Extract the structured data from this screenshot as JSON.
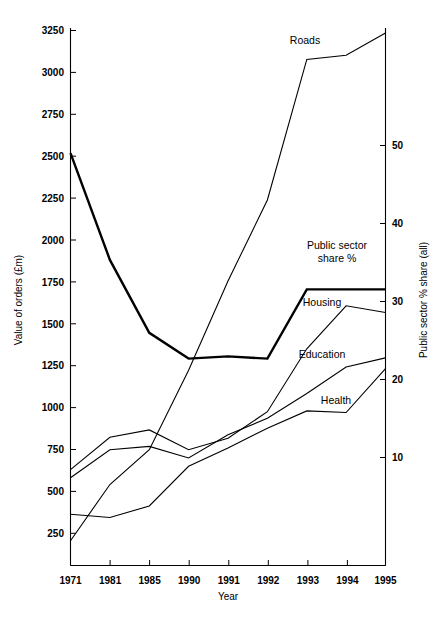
{
  "chart_data": {
    "type": "line",
    "title": "",
    "xlabel": "Year",
    "ylabel": "Value of orders (£m)",
    "y2label": "Public sector % share (all)",
    "categories": [
      "1971",
      "1981",
      "1985",
      "1990",
      "1991",
      "1992",
      "1993",
      "1994",
      "1995"
    ],
    "ylim": [
      0,
      3250
    ],
    "yticks": [
      250,
      500,
      750,
      1000,
      1250,
      1500,
      1750,
      2000,
      2250,
      2500,
      2750,
      3000,
      3250
    ],
    "y2lim": [
      0,
      73
    ],
    "y2ticks": [
      10,
      20,
      30,
      40,
      50
    ],
    "grid": false,
    "legend": "inline-labels",
    "series": [
      {
        "name": "Roads",
        "axis": "left",
        "label": "Roads",
        "values": [
          150,
          490,
          700,
          1180,
          1720,
          2210,
          3060,
          3085,
          3220
        ]
      },
      {
        "name": "Public sector share %",
        "axis": "right",
        "label": "Public sector share %",
        "emphasis": "thick",
        "values": [
          56.0,
          41.5,
          31.6,
          28.1,
          28.4,
          28.1,
          37.5,
          37.5,
          37.5
        ],
        "values_left_axis_equivalent": [
          2600,
          1930,
          1470,
          1305,
          1320,
          1305,
          1745,
          1745,
          1745
        ]
      },
      {
        "name": "Housing",
        "axis": "left",
        "label": "Housing",
        "values": [
          580,
          775,
          820,
          700,
          770,
          930,
          1310,
          1570,
          1530
        ]
      },
      {
        "name": "Education",
        "axis": "left",
        "label": "Education",
        "values": [
          530,
          700,
          720,
          650,
          790,
          890,
          1040,
          1200,
          1255
        ]
      },
      {
        "name": "Health",
        "axis": "left",
        "label": "Health",
        "values": [
          310,
          290,
          360,
          600,
          710,
          830,
          935,
          925,
          1190
        ]
      }
    ]
  },
  "axes": {
    "left": {
      "title": "Value of orders (£m)",
      "tick_labels": [
        "3250",
        "3000",
        "2750",
        "2500",
        "2250",
        "2000",
        "1750",
        "1500",
        "1250",
        "1000",
        "750",
        "500",
        "250"
      ]
    },
    "right": {
      "title": "Public sector % share (all)",
      "tick_labels": [
        "50",
        "40",
        "30",
        "20",
        "10"
      ]
    },
    "bottom": {
      "title": "Year",
      "tick_labels": [
        "1971",
        "1981",
        "1985",
        "1990",
        "1991",
        "1992",
        "1993",
        "1994",
        "1995"
      ]
    }
  },
  "series_labels": {
    "roads": "Roads",
    "public_sector_line1": "Public sector",
    "public_sector_line2": "share %",
    "housing": "Housing",
    "education": "Education",
    "health": "Health"
  },
  "colors": {
    "line": "#000000",
    "background": "#ffffff",
    "text": "#000000"
  }
}
